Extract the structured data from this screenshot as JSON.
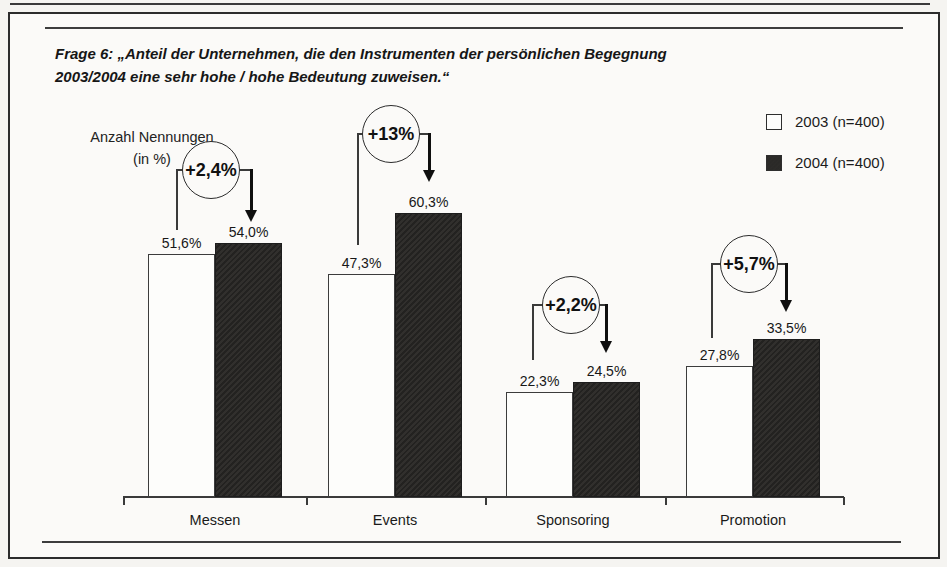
{
  "title": {
    "line1": "Frage 6: „Anteil der Unternehmen, die den Instrumenten der persönlichen Begegnung",
    "line2": "2003/2004 eine sehr hohe / hohe Bedeutung zuweisen.“"
  },
  "y_axis_label": {
    "line1": "Anzahl Nennungen",
    "line2": "(in %)"
  },
  "legend": {
    "items": [
      {
        "label": "2003 (n=400)",
        "swatch": "white"
      },
      {
        "label": "2004 (n=400)",
        "swatch": "dark"
      }
    ]
  },
  "chart_data": {
    "type": "bar",
    "title": "Frage 6: „Anteil der Unternehmen, die den Instrumenten der persönlichen Begegnung 2003/2004 eine sehr hohe / hohe Bedeutung zuweisen.“",
    "ylabel": "Anzahl Nennungen (in %)",
    "xlabel": "",
    "categories": [
      "Messen",
      "Events",
      "Sponsoring",
      "Promotion"
    ],
    "series": [
      {
        "name": "2003 (n=400)",
        "color": "#fdfdfb",
        "values": [
          51.6,
          47.3,
          22.3,
          27.8
        ],
        "labels": [
          "51,6%",
          "47,3%",
          "22,3%",
          "27,8%"
        ]
      },
      {
        "name": "2004 (n=400)",
        "color": "#2b2a28",
        "values": [
          54.0,
          60.3,
          24.5,
          33.5
        ],
        "labels": [
          "54,0%",
          "60,3%",
          "24,5%",
          "33,5%"
        ]
      }
    ],
    "changes": [
      "+2,4%",
      "+13%",
      "+2,2%",
      "+5,7%"
    ],
    "ylim": [
      0,
      65
    ],
    "grid": false,
    "legend_position": "top-right"
  },
  "colors": {
    "bar_2003": "#fdfdfb",
    "bar_2004": "#2b2a28",
    "line": "#3a3a3a",
    "background": "#f5f4f1"
  }
}
